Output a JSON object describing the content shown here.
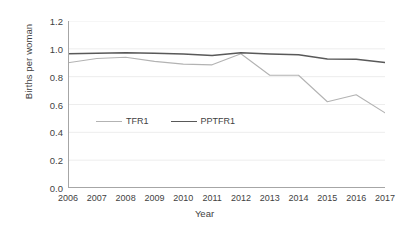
{
  "chart_data": {
    "type": "line",
    "title": "",
    "xlabel": "Year",
    "ylabel": "Births per woman",
    "categories": [
      "2006",
      "2007",
      "2008",
      "2009",
      "2010",
      "2011",
      "2012",
      "2013",
      "2014",
      "2015",
      "2016",
      "2017"
    ],
    "x": [
      2006,
      2007,
      2008,
      2009,
      2010,
      2011,
      2012,
      2013,
      2014,
      2015,
      2016,
      2017
    ],
    "xlim": [
      2006,
      2017
    ],
    "ylim": [
      0.0,
      1.2
    ],
    "yticks": [
      "0.0",
      "0.2",
      "0.4",
      "0.6",
      "0.8",
      "1.0",
      "1.2"
    ],
    "ytick_values": [
      0.0,
      0.2,
      0.4,
      0.6,
      0.8,
      1.0,
      1.2
    ],
    "grid": "horizontal",
    "legend_position": "inside-center",
    "series": [
      {
        "name": "TFR1",
        "color": "#b3b3b3",
        "values": [
          0.9,
          0.93,
          0.94,
          0.91,
          0.89,
          0.885,
          0.965,
          0.81,
          0.81,
          0.62,
          0.67,
          0.54
        ]
      },
      {
        "name": "PPTFR1",
        "color": "#595959",
        "values": [
          0.965,
          0.968,
          0.972,
          0.968,
          0.962,
          0.952,
          0.972,
          0.963,
          0.958,
          0.927,
          0.926,
          0.902
        ]
      }
    ]
  },
  "axes": {
    "y_title": "Births per woman",
    "x_title": "Year"
  },
  "colors": {
    "series_tfr1": "#b3b3b3",
    "series_pptfr1": "#595959",
    "axis": "#a6a6a6",
    "grid": "#ededed",
    "text": "#3f3f3f"
  }
}
